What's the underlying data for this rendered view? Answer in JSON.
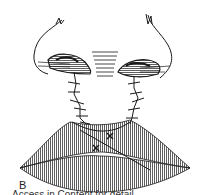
{
  "figure": {
    "panel_label": "B",
    "caption_cropped": "Access in Content for detail",
    "colors": {
      "ink": "#1a1a1a",
      "background": "#ffffff"
    },
    "elements": [
      "nose-base",
      "left-nostril",
      "right-nostril",
      "columella",
      "left-suture-line",
      "right-suture-line",
      "upper-lip",
      "lower-lip",
      "lip-suture-marks"
    ]
  }
}
